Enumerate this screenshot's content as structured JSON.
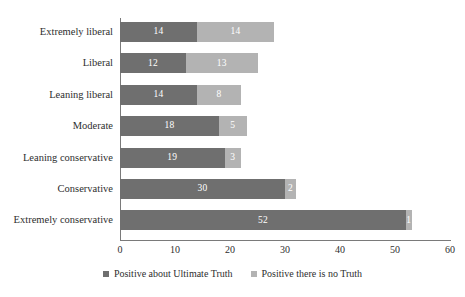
{
  "chart_data": {
    "type": "bar",
    "orientation": "horizontal",
    "stacked": true,
    "title": "",
    "subtitle": "",
    "xlabel": "",
    "ylabel": "",
    "xlim": [
      0,
      60
    ],
    "xticks": [
      0,
      10,
      20,
      30,
      40,
      50,
      60
    ],
    "grid": false,
    "legend_position": "bottom",
    "categories": [
      "Extremely liberal",
      "Liberal",
      "Leaning liberal",
      "Moderate",
      "Leaning conservative",
      "Conservative",
      "Extremely conservative"
    ],
    "series": [
      {
        "name": "Positive about Ultimate Truth",
        "color": "#6f6f6f",
        "values": [
          14,
          12,
          14,
          18,
          19,
          30,
          52
        ]
      },
      {
        "name": "Positive there is no Truth",
        "color": "#b3b3b3",
        "values": [
          14,
          13,
          8,
          5,
          3,
          2,
          1
        ]
      }
    ]
  },
  "axis": {
    "tick_labels": [
      "0",
      "10",
      "20",
      "30",
      "40",
      "50",
      "60"
    ]
  },
  "legend": {
    "items": [
      {
        "label": "Positive about Ultimate Truth",
        "color": "#6f6f6f"
      },
      {
        "label": "Positive there is no Truth",
        "color": "#b3b3b3"
      }
    ]
  }
}
